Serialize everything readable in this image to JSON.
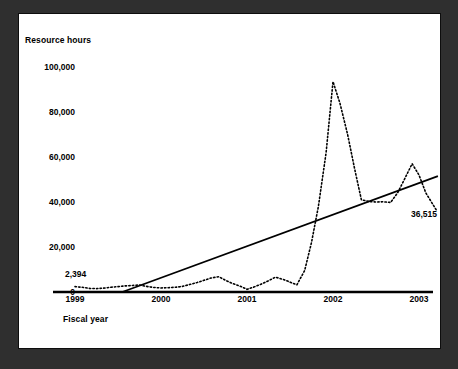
{
  "figure": {
    "background_color": "#2f2f2f",
    "panel_color": "#ffffff",
    "frame_color": "#0d0d0d"
  },
  "chart_data": {
    "type": "line",
    "title": "",
    "subtitle": "",
    "xlabel": "Fiscal year",
    "ylabel": "Resource hours",
    "xlim": [
      1999.0,
      2003.25
    ],
    "ylim": [
      0,
      100000
    ],
    "grid": false,
    "legend": false,
    "legend_position": "none",
    "x_tick_labels": [
      "1999",
      "2000",
      "2001",
      "2002",
      "2003"
    ],
    "x_tick_values": [
      1999,
      2000,
      2001,
      2002,
      2003
    ],
    "y_tick_labels": [
      "0",
      "20,000",
      "40,000",
      "60,000",
      "80,000",
      "100,000"
    ],
    "y_tick_values": [
      0,
      20000,
      40000,
      60000,
      80000,
      100000
    ],
    "annotations": [
      {
        "text": "2,394",
        "x": 1999.05,
        "y": 2394,
        "note": "first data point of monthly series"
      },
      {
        "text": "36,515",
        "x": 2003.2,
        "y": 36515,
        "note": "last data point of monthly series"
      }
    ],
    "series": [
      {
        "name": "Resource hours (actual)",
        "style": "dotted",
        "color": "#000000",
        "x": [
          1999.0,
          1999.08,
          1999.17,
          1999.25,
          1999.33,
          1999.42,
          1999.5,
          1999.58,
          1999.67,
          1999.75,
          1999.83,
          1999.92,
          2000.0,
          2000.08,
          2000.17,
          2000.25,
          2000.33,
          2000.42,
          2000.5,
          2000.58,
          2000.67,
          2000.75,
          2000.83,
          2000.92,
          2001.0,
          2001.08,
          2001.17,
          2001.25,
          2001.33,
          2001.42,
          2001.5,
          2001.58,
          2001.67,
          2001.75,
          2001.83,
          2001.92,
          2002.0,
          2002.08,
          2002.17,
          2002.25,
          2002.33,
          2002.42,
          2002.5,
          2002.58,
          2002.67,
          2002.75,
          2002.83,
          2002.92,
          2003.0,
          2003.08,
          2003.2
        ],
        "values": [
          2394,
          2100,
          1600,
          1500,
          1700,
          2100,
          2400,
          2700,
          2900,
          3100,
          2500,
          2000,
          1800,
          1900,
          2100,
          2500,
          3300,
          4200,
          5200,
          6200,
          6800,
          5200,
          3800,
          2600,
          1200,
          2200,
          3600,
          5000,
          6600,
          5600,
          4400,
          3200,
          9500,
          22000,
          38000,
          62000,
          93500,
          84000,
          70000,
          55000,
          41000,
          40200,
          40000,
          40100,
          39800,
          44000,
          50000,
          57000,
          52000,
          44000,
          36515
        ]
      },
      {
        "name": "Trend line",
        "style": "solid",
        "color": "#000000",
        "x": [
          1999.55,
          2003.22
        ],
        "values": [
          0,
          51500
        ]
      }
    ]
  },
  "axis": {
    "baseline_visible": true,
    "baseline_color": "#000000"
  }
}
